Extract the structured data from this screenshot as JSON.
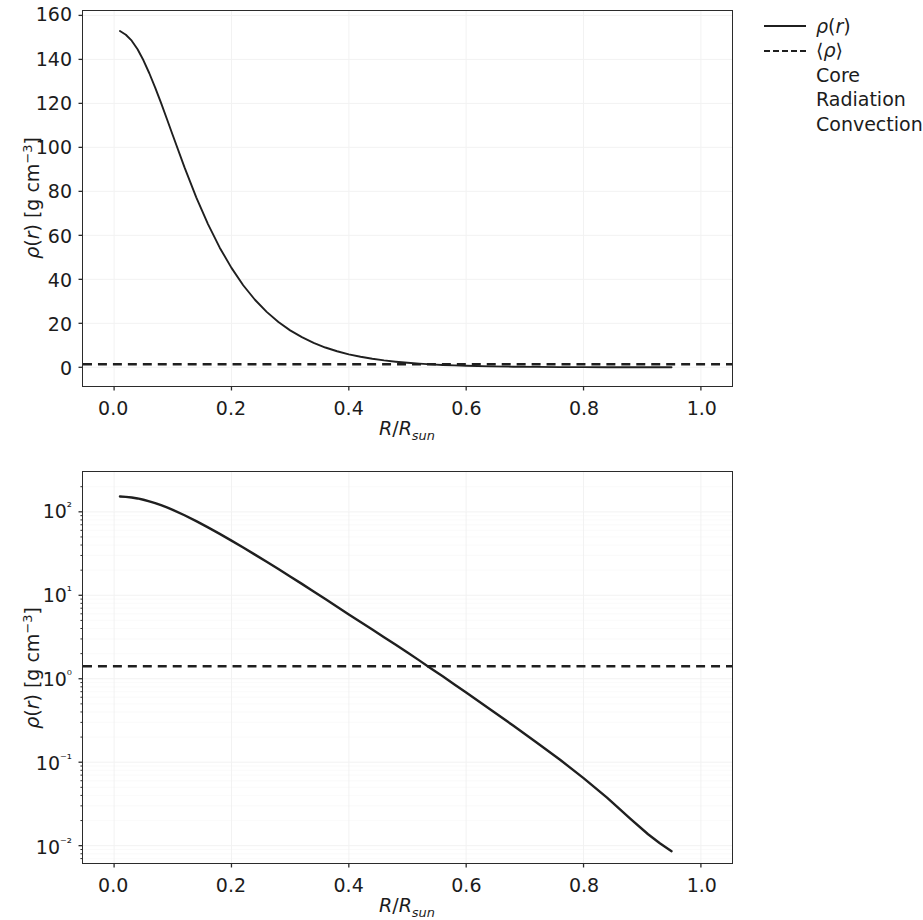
{
  "figure": {
    "background_color": "#ffffff",
    "line_color": "#1f1f1f",
    "grid_color": "#f2f2f2",
    "axis_color": "#2b2b2b"
  },
  "legend": {
    "position": "upper right outside",
    "entries": [
      {
        "label": "ρ(r)",
        "style": "solid",
        "key": "rho-r"
      },
      {
        "label": "⟨ρ⟩",
        "style": "dashed",
        "key": "rho-mean"
      },
      {
        "label": "Core",
        "style": "none",
        "key": "core"
      },
      {
        "label": "Radiation",
        "style": "none",
        "key": "radiation"
      },
      {
        "label": "Convection",
        "style": "none",
        "key": "convection"
      }
    ]
  },
  "chart_data": [
    {
      "id": "density-linear",
      "type": "line",
      "title": "",
      "xlabel": "R/R_sun",
      "ylabel": "ρ(r) [g cm⁻³]",
      "xscale": "linear",
      "yscale": "linear",
      "xlim": [
        -0.053,
        1.053
      ],
      "ylim": [
        -8.5,
        162.0
      ],
      "xticks": [
        0.0,
        0.2,
        0.4,
        0.6,
        0.8,
        1.0
      ],
      "xticklabels": [
        "0.0",
        "0.2",
        "0.4",
        "0.6",
        "0.8",
        "1.0"
      ],
      "yticks": [
        0,
        20,
        40,
        60,
        80,
        100,
        120,
        140,
        160
      ],
      "yticklabels": [
        "0",
        "20",
        "40",
        "60",
        "80",
        "100",
        "120",
        "140",
        "160"
      ],
      "grid": true,
      "series": [
        {
          "name": "ρ(r)",
          "style": "solid",
          "x": [
            0.01,
            0.02,
            0.03,
            0.04,
            0.05,
            0.06,
            0.07,
            0.08,
            0.09,
            0.1,
            0.12,
            0.14,
            0.16,
            0.18,
            0.2,
            0.22,
            0.24,
            0.26,
            0.28,
            0.3,
            0.32,
            0.34,
            0.36,
            0.38,
            0.4,
            0.42,
            0.44,
            0.46,
            0.48,
            0.5,
            0.52,
            0.54,
            0.56,
            0.58,
            0.6,
            0.64,
            0.68,
            0.72,
            0.76,
            0.8,
            0.84,
            0.88,
            0.91,
            0.93,
            0.95
          ],
          "y": [
            152.9,
            151.2,
            148.5,
            144.6,
            139.6,
            133.7,
            127.2,
            120.2,
            112.9,
            105.5,
            90.9,
            77.3,
            65.1,
            54.4,
            45.2,
            37.3,
            30.7,
            25.2,
            20.6,
            16.8,
            13.7,
            11.1,
            9.0,
            7.3,
            5.9,
            4.8,
            3.9,
            3.15,
            2.55,
            2.06,
            1.66,
            1.33,
            1.07,
            0.855,
            0.684,
            0.435,
            0.275,
            0.172,
            0.107,
            0.0645,
            0.0377,
            0.021,
            0.0137,
            0.0107,
            0.0086
          ]
        },
        {
          "name": "⟨ρ⟩",
          "style": "dashed",
          "constant_y": 1.41
        }
      ],
      "mean_density": 1.41
    },
    {
      "id": "density-log",
      "type": "line",
      "title": "",
      "xlabel": "R/R_sun",
      "ylabel": "ρ(r) [g cm⁻³]",
      "xscale": "linear",
      "yscale": "log",
      "xlim": [
        -0.053,
        1.053
      ],
      "ylim": [
        0.0062,
        300.0
      ],
      "xticks": [
        0.0,
        0.2,
        0.4,
        0.6,
        0.8,
        1.0
      ],
      "xticklabels": [
        "0.0",
        "0.2",
        "0.4",
        "0.6",
        "0.8",
        "1.0"
      ],
      "yticks": [
        0.01,
        0.1,
        1.0,
        10.0,
        100.0
      ],
      "yticklabels": [
        "10⁻²",
        "10⁻¹",
        "10⁰",
        "10¹",
        "10²"
      ],
      "grid": true,
      "series": [
        {
          "name": "ρ(r)",
          "style": "solid",
          "x": [
            0.01,
            0.02,
            0.03,
            0.04,
            0.05,
            0.06,
            0.07,
            0.08,
            0.09,
            0.1,
            0.12,
            0.14,
            0.16,
            0.18,
            0.2,
            0.22,
            0.24,
            0.26,
            0.28,
            0.3,
            0.32,
            0.34,
            0.36,
            0.38,
            0.4,
            0.42,
            0.44,
            0.46,
            0.48,
            0.5,
            0.52,
            0.54,
            0.56,
            0.58,
            0.6,
            0.64,
            0.68,
            0.72,
            0.76,
            0.8,
            0.84,
            0.88,
            0.91,
            0.93,
            0.95
          ],
          "y": [
            152.9,
            151.2,
            148.5,
            144.6,
            139.6,
            133.7,
            127.2,
            120.2,
            112.9,
            105.5,
            90.9,
            77.3,
            65.1,
            54.4,
            45.2,
            37.3,
            30.7,
            25.2,
            20.6,
            16.8,
            13.7,
            11.1,
            9.0,
            7.3,
            5.9,
            4.8,
            3.9,
            3.15,
            2.55,
            2.06,
            1.66,
            1.33,
            1.07,
            0.855,
            0.684,
            0.435,
            0.275,
            0.172,
            0.107,
            0.0645,
            0.0377,
            0.021,
            0.0137,
            0.0107,
            0.0086
          ]
        },
        {
          "name": "⟨ρ⟩",
          "style": "dashed",
          "constant_y": 1.41
        }
      ],
      "mean_density": 1.41
    }
  ]
}
